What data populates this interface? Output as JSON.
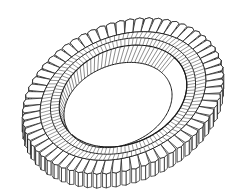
{
  "figure": {
    "background": "#ffffff",
    "stroke": "#1a1a1a",
    "fill": "#ffffff"
  },
  "geometry": {
    "center": [
      123,
      96
    ],
    "tilt_deg": -22,
    "thickness_px": 14,
    "tooth_count": 64,
    "outer_tooth": {
      "rx": 103,
      "ry": 72
    },
    "tooth_root": {
      "rx": 86,
      "ry": 60
    },
    "ring_top_outer": {
      "rx": 75,
      "ry": 55
    },
    "ring_top_inner": {
      "rx": 66,
      "ry": 48
    },
    "bore_bottom": {
      "rx": 56,
      "ry": 40,
      "dx": -5,
      "dy": 9
    },
    "bore_hatch_count": 90,
    "ring_hatch_count": 110
  }
}
